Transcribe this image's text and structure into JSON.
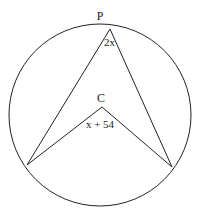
{
  "diagram": {
    "type": "circle-geometry",
    "points": {
      "top": "P",
      "center": "C"
    },
    "angles": {
      "inscribed_at_P": "2x",
      "central_at_C": "x + 54"
    },
    "labels": {
      "P": "P",
      "C": "C",
      "angle_P_var": "2x",
      "angle_C_expr": "x + 54"
    },
    "colors": {
      "stroke": "#222222",
      "background": "#ffffff"
    }
  }
}
